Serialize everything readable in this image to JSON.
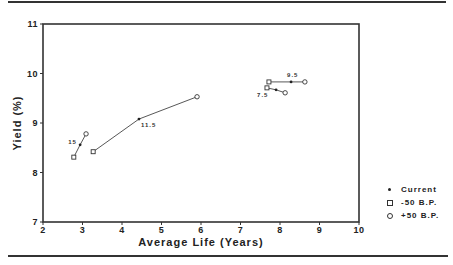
{
  "chart_data": {
    "type": "scatter",
    "title": "",
    "xlabel": "Average Life (Years)",
    "ylabel": "Yield (%)",
    "xlim": [
      2,
      10
    ],
    "ylim": [
      7,
      11
    ],
    "xticks": [
      "2",
      "3",
      "4",
      "5",
      "6",
      "7",
      "8",
      "9",
      "10"
    ],
    "yticks": [
      "7",
      "8",
      "9",
      "10",
      "11"
    ],
    "grid": false,
    "legend_position": "right",
    "series": [
      {
        "name": "Current",
        "marker": "dot",
        "points": [
          {
            "label": "15",
            "x": 2.94,
            "y": 8.56
          },
          {
            "label": "11.5",
            "x": 4.43,
            "y": 9.08
          },
          {
            "label": "9.5",
            "x": 8.28,
            "y": 9.83
          },
          {
            "label": "7.5",
            "x": 7.9,
            "y": 9.67
          }
        ]
      },
      {
        "name": "-50 B.P.",
        "marker": "square",
        "points": [
          {
            "label": "15",
            "x": 2.78,
            "y": 8.31
          },
          {
            "label": "11.5",
            "x": 3.27,
            "y": 8.42
          },
          {
            "label": "9.5",
            "x": 7.72,
            "y": 9.83
          },
          {
            "label": "7.5",
            "x": 7.67,
            "y": 9.71
          }
        ]
      },
      {
        "name": "+50 B.P.",
        "marker": "circle",
        "points": [
          {
            "label": "15",
            "x": 3.09,
            "y": 8.78
          },
          {
            "label": "11.5",
            "x": 5.9,
            "y": 9.53
          },
          {
            "label": "9.5",
            "x": 8.63,
            "y": 9.83
          },
          {
            "label": "7.5",
            "x": 8.13,
            "y": 9.61
          }
        ]
      }
    ],
    "annotations": [
      "15",
      "11.5",
      "9.5",
      "7.5"
    ]
  },
  "axes": {
    "xlabel": "Average Life (Years)",
    "ylabel": "Yield (%)"
  },
  "legend": [
    {
      "marker": "dot",
      "label": "Current"
    },
    {
      "marker": "square",
      "label": "-50 B.P."
    },
    {
      "marker": "circle",
      "label": "+50 B.P."
    }
  ]
}
